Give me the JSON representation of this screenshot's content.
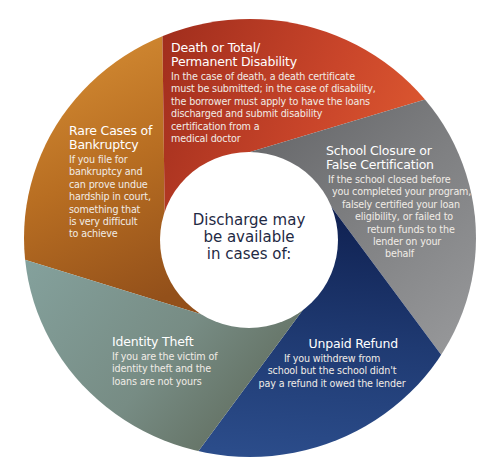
{
  "center": {
    "lines": [
      "Discharge may",
      "be available",
      "in cases of:"
    ]
  },
  "segments": [
    {
      "id": "death-disability",
      "title": [
        "Death or Total/",
        "Permanent Disability"
      ],
      "body": [
        "In the case of death, a death certificate",
        "must be submitted; in the case of disability,",
        "the borrower must apply to have the loans",
        "discharged and submit disability",
        "certification from a",
        "medical doctor"
      ],
      "color": "#c8452a"
    },
    {
      "id": "school-closure",
      "title": [
        "School Closure or",
        "False Certification"
      ],
      "body": [
        "If the school closed before",
        "you completed your program,",
        "falsely certified your loan",
        "eligibility, or failed to",
        "return funds to the",
        "lender on your",
        "behalf"
      ],
      "color": "#7d7e80"
    },
    {
      "id": "unpaid-refund",
      "title": [
        "Unpaid Refund"
      ],
      "body": [
        "If you withdrew from",
        "school but the school didn't",
        "pay a refund it owed the lender"
      ],
      "color": "#213f78"
    },
    {
      "id": "identity-theft",
      "title": [
        "Identity Theft"
      ],
      "body": [
        "If you are the victim of",
        "identity theft and the",
        "loans are not yours"
      ],
      "color": "#7b918b"
    },
    {
      "id": "bankruptcy",
      "title": [
        "Rare Cases of",
        "Bankruptcy"
      ],
      "body": [
        "If you file for",
        "bankruptcy and",
        "can prove undue",
        "hardship in court,",
        "something that",
        "is very difficult",
        "to achieve"
      ],
      "color": "#b56f24"
    }
  ]
}
